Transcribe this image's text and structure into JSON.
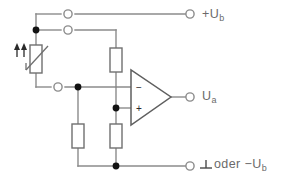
{
  "diagram": {
    "type": "electronic-schematic",
    "background_color": "#ffffff",
    "wire_color": "#8b8b8b",
    "node_color": "#121212",
    "label_color": "#6a6a6a"
  },
  "labels": {
    "supply_positive": "+U",
    "supply_positive_sub": "b",
    "output": "U",
    "output_sub": "a",
    "ground_text": "oder −U",
    "ground_sub": "b",
    "ground_symbol_name": "earth-ground-symbol"
  },
  "opamp": {
    "inverting_sign": "−",
    "noninverting_sign": "+",
    "name": "operational-amplifier"
  },
  "components": [
    {
      "id": "ldr",
      "name": "light-dependent-resistor",
      "kind": "variable-resistor",
      "arrows": 2,
      "arrow_direction": "up"
    },
    {
      "id": "r1",
      "name": "resistor-upper-divider",
      "kind": "resistor"
    },
    {
      "id": "r2",
      "name": "resistor-lower-left",
      "kind": "resistor"
    },
    {
      "id": "r3",
      "name": "resistor-lower-divider",
      "kind": "resistor"
    }
  ],
  "terminals": [
    {
      "id": "t-vplus-left",
      "name": "terminal-supply-left-top",
      "shape": "open-circle"
    },
    {
      "id": "t-vplus-left2",
      "name": "terminal-supply-left-second",
      "shape": "open-circle"
    },
    {
      "id": "t-input-left",
      "name": "terminal-input-left",
      "shape": "open-circle"
    },
    {
      "id": "t-vplus",
      "name": "terminal-supply-positive",
      "shape": "open-circle"
    },
    {
      "id": "t-out",
      "name": "terminal-output",
      "shape": "open-circle"
    },
    {
      "id": "t-gnd",
      "name": "terminal-ground",
      "shape": "open-circle"
    }
  ],
  "junctions": [
    {
      "name": "node-supply-left"
    },
    {
      "name": "node-inverting-input"
    },
    {
      "name": "node-noninverting-input"
    },
    {
      "name": "node-ground-rail"
    }
  ]
}
